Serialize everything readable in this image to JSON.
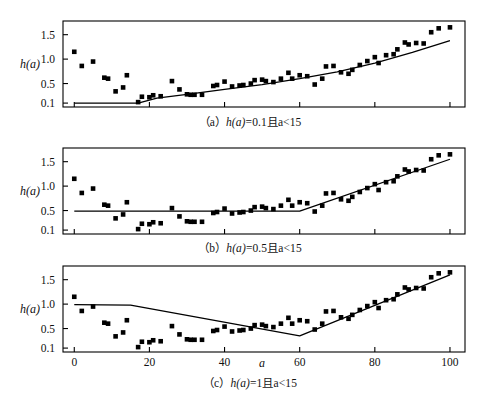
{
  "figure": {
    "axis_label_y": "h(a)",
    "axis_label_x": "a",
    "y_ticks": [
      "0.1",
      "0.5",
      "1.0",
      "1.5"
    ],
    "x_ticks": [
      "0",
      "20",
      "40",
      "60",
      "80",
      "100"
    ],
    "line_color": "#000000",
    "marker_color": "#000000",
    "frame_color": "#000000"
  },
  "panels": [
    {
      "id": "a",
      "caption_prefix": "（a）",
      "caption_body": "h(a)",
      "caption_tail": "=0.1且a<15",
      "show_x_labels": false,
      "show_x_axis_title": false
    },
    {
      "id": "b",
      "caption_prefix": "（b）",
      "caption_body": "h(a)",
      "caption_tail": "=0.5且a<15",
      "show_x_labels": false,
      "show_x_axis_title": false
    },
    {
      "id": "c",
      "caption_prefix": "（c）",
      "caption_body": "h(a)",
      "caption_tail": "=1且a<15",
      "show_x_labels": true,
      "show_x_axis_title": true
    }
  ],
  "chart_data": [
    {
      "type": "scatter",
      "panel": "a",
      "title": "（a）h(a)=0.1且a<15",
      "xlabel": "a",
      "ylabel": "h(a)",
      "xlim": [
        -3,
        104
      ],
      "ylim": [
        0.02,
        1.78
      ],
      "yticks": [
        0.1,
        0.5,
        1.0,
        1.5
      ],
      "xticks": [
        0,
        20,
        40,
        60,
        80,
        100
      ],
      "grid": false,
      "legend": "none",
      "scatter": {
        "x": [
          0,
          2,
          5,
          8,
          9,
          11,
          13,
          14,
          17,
          18,
          20,
          21,
          23,
          26,
          28,
          30,
          31,
          32,
          34,
          37,
          38,
          40,
          42,
          44,
          45,
          47,
          48,
          50,
          51,
          53,
          55,
          57,
          58,
          60,
          62,
          64,
          66,
          67,
          69,
          71,
          73,
          74,
          76,
          78,
          80,
          81,
          83,
          85,
          86,
          88,
          89,
          91,
          93,
          95,
          97,
          100
        ],
        "y": [
          1.15,
          0.86,
          0.95,
          0.62,
          0.6,
          0.34,
          0.42,
          0.67,
          0.12,
          0.23,
          0.22,
          0.26,
          0.24,
          0.55,
          0.38,
          0.28,
          0.27,
          0.27,
          0.27,
          0.45,
          0.47,
          0.54,
          0.44,
          0.46,
          0.47,
          0.5,
          0.57,
          0.58,
          0.55,
          0.53,
          0.6,
          0.72,
          0.6,
          0.67,
          0.65,
          0.48,
          0.6,
          0.85,
          0.86,
          0.73,
          0.7,
          0.78,
          0.88,
          0.96,
          1.04,
          0.92,
          1.08,
          1.1,
          1.2,
          1.34,
          1.3,
          1.33,
          1.32,
          1.55,
          1.63,
          1.65
        ]
      },
      "fit_line": {
        "comment": "flat at 0.1 then smoothly rising curve",
        "x": [
          0,
          17,
          22,
          30,
          40,
          50,
          60,
          70,
          80,
          90,
          100
        ],
        "y": [
          0.1,
          0.1,
          0.2,
          0.28,
          0.38,
          0.48,
          0.6,
          0.74,
          0.92,
          1.14,
          1.38
        ]
      }
    },
    {
      "type": "scatter",
      "panel": "b",
      "title": "（b）h(a)=0.5且a<15",
      "xlabel": "a",
      "ylabel": "h(a)",
      "xlim": [
        -3,
        104
      ],
      "ylim": [
        0.02,
        1.78
      ],
      "yticks": [
        0.1,
        0.5,
        1.0,
        1.5
      ],
      "xticks": [
        0,
        20,
        40,
        60,
        80,
        100
      ],
      "grid": false,
      "legend": "none",
      "scatter": {
        "x": [
          0,
          2,
          5,
          8,
          9,
          11,
          13,
          14,
          17,
          18,
          20,
          21,
          23,
          26,
          28,
          30,
          31,
          32,
          34,
          37,
          38,
          40,
          42,
          44,
          45,
          47,
          48,
          50,
          51,
          53,
          55,
          57,
          58,
          60,
          62,
          64,
          66,
          67,
          69,
          71,
          73,
          74,
          76,
          78,
          80,
          81,
          83,
          85,
          86,
          88,
          89,
          91,
          93,
          95,
          97,
          100
        ],
        "y": [
          1.15,
          0.86,
          0.95,
          0.62,
          0.6,
          0.34,
          0.42,
          0.67,
          0.12,
          0.23,
          0.22,
          0.26,
          0.24,
          0.55,
          0.38,
          0.28,
          0.27,
          0.27,
          0.27,
          0.45,
          0.47,
          0.54,
          0.44,
          0.46,
          0.47,
          0.5,
          0.57,
          0.58,
          0.55,
          0.53,
          0.6,
          0.72,
          0.6,
          0.67,
          0.65,
          0.48,
          0.6,
          0.85,
          0.86,
          0.73,
          0.7,
          0.78,
          0.88,
          0.96,
          1.04,
          0.92,
          1.08,
          1.1,
          1.2,
          1.34,
          1.3,
          1.33,
          1.32,
          1.55,
          1.63,
          1.65
        ]
      },
      "fit_line": {
        "comment": "flat at 0.5 until a=60, then linear rise to 1.55",
        "x": [
          0,
          60,
          100
        ],
        "y": [
          0.49,
          0.49,
          1.55
        ]
      }
    },
    {
      "type": "scatter",
      "panel": "c",
      "title": "（c）h(a)=1且a<15",
      "xlabel": "a",
      "ylabel": "h(a)",
      "xlim": [
        -3,
        104
      ],
      "ylim": [
        0.02,
        1.78
      ],
      "yticks": [
        0.1,
        0.5,
        1.0,
        1.5
      ],
      "xticks": [
        0,
        20,
        40,
        60,
        80,
        100
      ],
      "grid": false,
      "legend": "none",
      "scatter": {
        "x": [
          0,
          2,
          5,
          8,
          9,
          11,
          13,
          14,
          17,
          18,
          20,
          21,
          23,
          26,
          28,
          30,
          31,
          32,
          34,
          37,
          38,
          40,
          42,
          44,
          45,
          47,
          48,
          50,
          51,
          53,
          55,
          57,
          58,
          60,
          62,
          64,
          66,
          67,
          69,
          71,
          73,
          74,
          76,
          78,
          80,
          81,
          83,
          85,
          86,
          88,
          89,
          91,
          93,
          95,
          97,
          100
        ],
        "y": [
          1.15,
          0.86,
          0.95,
          0.62,
          0.6,
          0.34,
          0.42,
          0.67,
          0.12,
          0.23,
          0.22,
          0.26,
          0.24,
          0.55,
          0.38,
          0.28,
          0.27,
          0.27,
          0.27,
          0.45,
          0.47,
          0.54,
          0.44,
          0.46,
          0.47,
          0.5,
          0.57,
          0.58,
          0.55,
          0.53,
          0.6,
          0.72,
          0.6,
          0.67,
          0.65,
          0.48,
          0.6,
          0.85,
          0.86,
          0.73,
          0.7,
          0.78,
          0.88,
          0.96,
          1.04,
          0.92,
          1.08,
          1.1,
          1.2,
          1.34,
          1.3,
          1.33,
          1.32,
          1.55,
          1.63,
          1.65
        ]
      },
      "fit_line": {
        "comment": "flat at 1.0 to a=15, falls to min 0.35 at a=60, then rises to 1.6",
        "x": [
          0,
          15,
          60,
          100
        ],
        "y": [
          0.99,
          0.98,
          0.35,
          1.6
        ]
      }
    }
  ]
}
